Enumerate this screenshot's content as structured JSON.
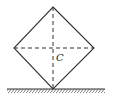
{
  "diagram": {
    "center_label": "C",
    "vertices": {
      "top": [
        53,
        7
      ],
      "left": [
        14,
        48
      ],
      "right": [
        94,
        48
      ],
      "bottom": [
        53,
        89
      ]
    },
    "ground": {
      "x1": 7,
      "x2": 105,
      "y": 89
    },
    "colors": {
      "stroke": "#333333",
      "background": "#ffffff"
    }
  }
}
